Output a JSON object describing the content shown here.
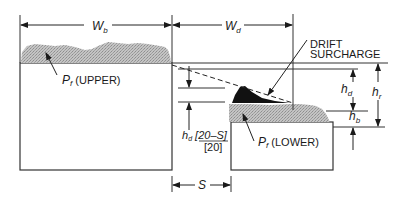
{
  "diagram": {
    "labels": {
      "wb_main": "W",
      "wb_sub": "b",
      "wd_main": "W",
      "wd_sub": "d",
      "drift_line1": "DRIFT",
      "drift_line2": "SURCHARGE",
      "hd_main": "h",
      "hd_sub": "d",
      "hr_main": "h",
      "hr_sub": "r",
      "hb_main": "h",
      "hb_sub": "b",
      "pf_upper_main": "P",
      "pf_upper_sub": "f",
      "pf_upper_text": " (UPPER)",
      "pf_lower_main": "P",
      "pf_lower_sub": "f",
      "pf_lower_text": " (LOWER)",
      "formula_h": "h",
      "formula_sub": "d",
      "formula_num": " [20–S]",
      "formula_den": "[20]",
      "s_label": "S"
    },
    "colors": {
      "line": "#1a1a1a",
      "snow": "#b8b8b8",
      "drift": "#111111",
      "background": "#ffffff"
    }
  }
}
